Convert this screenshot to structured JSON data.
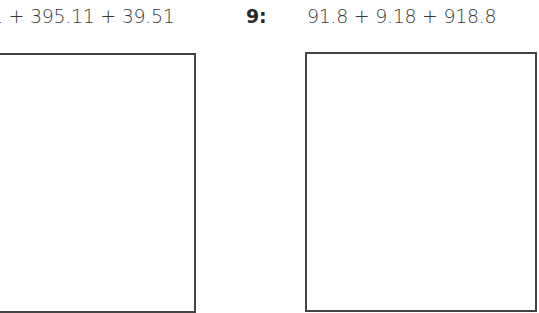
{
  "problems": [
    {
      "number": "",
      "expression": "1 + 395.11 + 39.51",
      "terms": [
        "1 (partially cropped)",
        "395.11",
        "39.51"
      ],
      "answer_box": "empty"
    },
    {
      "number": "9:",
      "expression": "91.8 + 9.18 + 918.8",
      "terms": [
        "91.8",
        "9.18",
        "918.8"
      ],
      "answer_box": "empty"
    }
  ],
  "colors": {
    "text": "#3a3a3a",
    "box_border": "#444444",
    "background": "#ffffff"
  }
}
